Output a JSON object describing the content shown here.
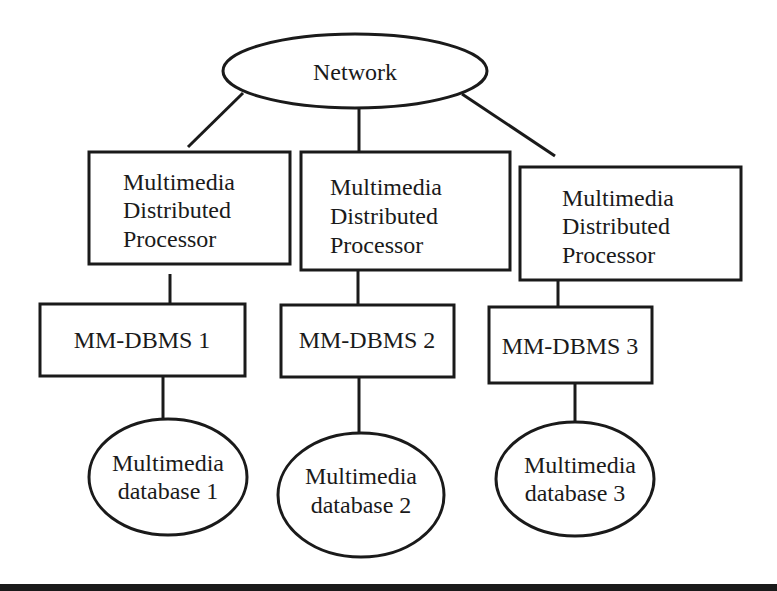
{
  "diagram": {
    "network": {
      "label": "Network"
    },
    "processors": [
      {
        "lines": [
          "Multimedia",
          "Distributed",
          "Processor"
        ]
      },
      {
        "lines": [
          "Multimedia",
          "Distributed",
          "Processor"
        ]
      },
      {
        "lines": [
          "Multimedia",
          "Distributed",
          "Processor"
        ]
      }
    ],
    "dbms": [
      {
        "label": "MM-DBMS 1"
      },
      {
        "label": "MM-DBMS 2"
      },
      {
        "label": "MM-DBMS 3"
      }
    ],
    "databases": [
      {
        "lines": [
          "Multimedia",
          "database 1"
        ]
      },
      {
        "lines": [
          "Multimedia",
          "database 2"
        ]
      },
      {
        "lines": [
          "Multimedia",
          "database 3"
        ]
      }
    ],
    "colors": {
      "stroke": "#1a1a1a",
      "background": "#ffffff"
    }
  }
}
